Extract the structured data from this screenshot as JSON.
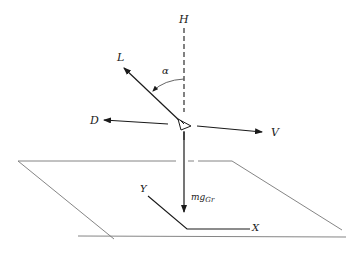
{
  "diagram": {
    "type": "free-body force diagram of aircraft above ground plane",
    "labels": {
      "H": "H",
      "L": "L",
      "alpha": "α",
      "D": "D",
      "V": "V",
      "weight_main": "mg",
      "weight_sub": "Gr",
      "Y": "Y",
      "X": "X"
    },
    "vectors": [
      {
        "name": "H",
        "description": "vertical reference (dashed)"
      },
      {
        "name": "L",
        "description": "lift vector"
      },
      {
        "name": "D",
        "description": "drag vector"
      },
      {
        "name": "V",
        "description": "velocity vector"
      },
      {
        "name": "mg_Gr",
        "description": "weight vector"
      }
    ],
    "angle": {
      "name": "α",
      "between": [
        "L",
        "H"
      ]
    },
    "ground_axes": [
      "X",
      "Y"
    ],
    "colors": {
      "line": "#1a1a1a",
      "plane": "#777777"
    }
  }
}
